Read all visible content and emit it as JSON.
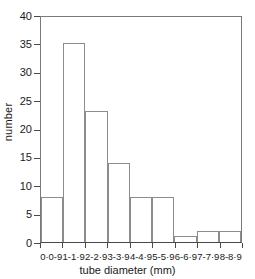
{
  "chart_data": {
    "type": "bar",
    "title": "",
    "subtitle": "",
    "xlabel": "tube diameter (mm)",
    "ylabel": "number",
    "categories": [
      "0·0-9",
      "1-1·9",
      "2-2·9",
      "3-3·9",
      "4-4·9",
      "5-5·9",
      "6-6·9",
      "7-7·9",
      "8-8·9"
    ],
    "values": [
      8,
      35,
      23,
      14,
      8,
      8,
      1,
      2,
      2
    ],
    "ylim": [
      0,
      40
    ],
    "yticks": [
      0,
      5,
      10,
      15,
      20,
      25,
      30,
      35,
      40
    ],
    "ytick_labels": [
      "0",
      "5",
      "10",
      "15",
      "20",
      "25",
      "30",
      "35",
      "40"
    ],
    "grid": false,
    "legend": null,
    "bar_fill_color": "#ffffff",
    "bar_edge_color": "#8c8c8c",
    "axis_color": "#4a4a4a",
    "background_color": "#ffffff"
  }
}
